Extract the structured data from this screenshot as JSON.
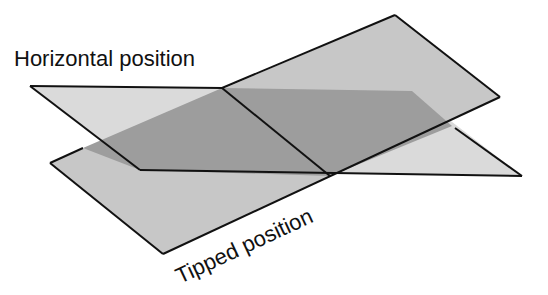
{
  "diagram": {
    "labels": {
      "horizontal": "Horizontal position",
      "tipped": "Tipped position"
    },
    "colors": {
      "background": "#ffffff",
      "horizontal_plane": "#d9d9d9",
      "tipped_plane": "#c6c6c6",
      "overlap": "#9c9c9c",
      "outline": "#111111",
      "text": "#111111"
    }
  }
}
